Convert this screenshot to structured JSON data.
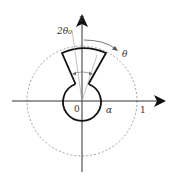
{
  "diagram": {
    "labels": {
      "z_axis": "z",
      "angle_span": "2θ₀",
      "angle": "θ",
      "origin": "0",
      "alpha": "α",
      "unit": "1"
    },
    "colors": {
      "stroke": "#1a1a1a",
      "dashed": "#888888",
      "thin": "#999999"
    }
  }
}
